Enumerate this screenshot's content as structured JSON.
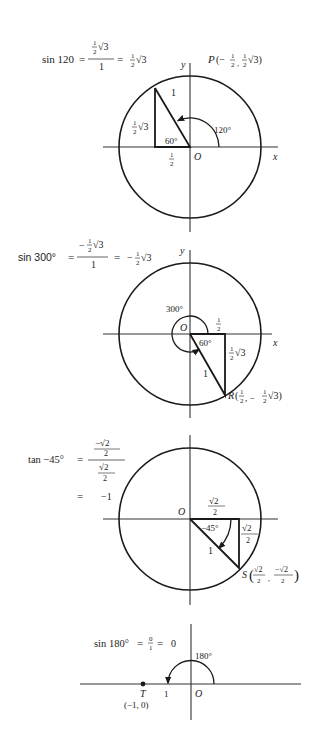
{
  "diagrams": [
    {
      "id": "sin120",
      "formula": {
        "lhs": "sin 120",
        "eq": "=",
        "num": "½√3",
        "num_frac_top": "1",
        "num_frac_bot": "2",
        "num_rad": "√3",
        "den": "1",
        "eq2": "=",
        "result_frac_top": "1",
        "result_frac_bot": "2",
        "result_rad": "√3"
      },
      "point_label": {
        "name": "P",
        "open": "(−",
        "x_top": "1",
        "x_bot": "2",
        "sep": ",",
        "y_top": "1",
        "y_bot": "2",
        "y_rad": "√3)"
      },
      "axis_x": "x",
      "axis_y": "y",
      "origin": "O",
      "hyp": "1",
      "opp_top": "1",
      "opp_bot": "2",
      "opp_rad": "√3",
      "adj_top": "1",
      "adj_bot": "2",
      "inner_angle": "60°",
      "angle": "120°"
    },
    {
      "id": "sin300",
      "formula": {
        "lhs": "sin 300°",
        "eq": "=",
        "num_sign": "−",
        "num_frac_top": "1",
        "num_frac_bot": "2",
        "num_rad": "√3",
        "den": "1",
        "eq2": "=",
        "result_sign": "−",
        "result_frac_top": "1",
        "result_frac_bot": "2",
        "result_rad": "√3"
      },
      "point_label": {
        "name": "R",
        "open": "(",
        "x_top": "1",
        "x_bot": "2",
        "sep": ", −",
        "y_top": "1",
        "y_bot": "2",
        "y_rad": "√3)"
      },
      "axis_x": "x",
      "axis_y": "y",
      "origin": "O",
      "hyp": "1",
      "opp_top": "1",
      "opp_bot": "2",
      "opp_rad": "√3",
      "adj_top": "1",
      "adj_bot": "2",
      "inner_angle": "60°",
      "angle": "300°"
    },
    {
      "id": "tan-45",
      "formula": {
        "lhs": "tan −45°",
        "eq": "=",
        "num_top": "−√2",
        "num_bot": "2",
        "den_top": "√2",
        "den_bot": "2",
        "eq2": "=",
        "result": "−1"
      },
      "point_label": {
        "name": "S",
        "x_top": "√2",
        "x_bot": "2",
        "sep": ",",
        "y_top": "−√2",
        "y_bot": "2"
      },
      "origin": "O",
      "hyp": "1",
      "adj_top": "√2",
      "adj_bot": "2",
      "opp_top": "√2",
      "opp_bot": "2",
      "angle": "−45°"
    },
    {
      "id": "sin180",
      "formula": {
        "lhs": "sin 180°",
        "eq": "=",
        "frac_top": "0",
        "frac_bot": "1",
        "eq2": "=",
        "result": "0"
      },
      "point_label": {
        "name": "T",
        "coords": "(−1, 0)"
      },
      "origin": "O",
      "unit": "1",
      "angle": "180°"
    }
  ]
}
